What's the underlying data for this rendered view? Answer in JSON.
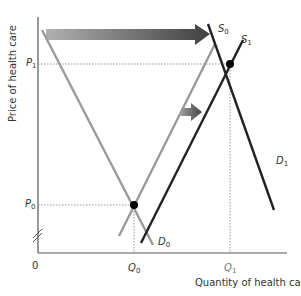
{
  "diagram": {
    "type": "supply-demand",
    "x_axis": {
      "label": "Quantity of health care",
      "origin": "0",
      "ticks": [
        {
          "main": "Q",
          "sub": "0"
        },
        {
          "main": "Q",
          "sub": "1"
        }
      ]
    },
    "y_axis": {
      "label": "Price of health care",
      "ticks": [
        {
          "main": "P",
          "sub": "1"
        },
        {
          "main": "P",
          "sub": "0"
        }
      ],
      "axis_break": true
    },
    "curves": {
      "s0": {
        "main": "S",
        "sub": "0",
        "color": "#9a9a9a"
      },
      "s1": {
        "main": "S",
        "sub": "1",
        "color": "#222222"
      },
      "d0": {
        "main": "D",
        "sub": "0",
        "color": "#9a9a9a"
      },
      "d1": {
        "main": "D",
        "sub": "1",
        "color": "#222222"
      }
    },
    "equilibria": [
      {
        "name": "initial",
        "price": "P0",
        "quantity": "Q0"
      },
      {
        "name": "new",
        "price": "P1",
        "quantity": "Q1"
      }
    ],
    "arrows": [
      {
        "name": "demand-shift-arrow",
        "direction": "right"
      },
      {
        "name": "supply-shift-arrow",
        "direction": "right"
      }
    ],
    "colors": {
      "axis": "#555555",
      "light_curve": "#9a9a9a",
      "dark_curve": "#222222",
      "arrow_dark": "#555555",
      "arrow_light": "#aaaaaa"
    }
  }
}
